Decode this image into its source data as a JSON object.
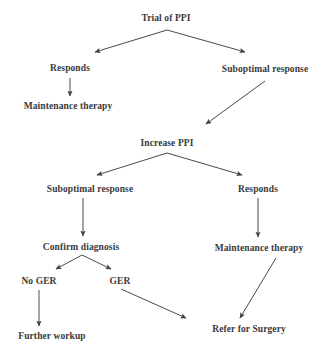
{
  "diagram": {
    "type": "flowchart",
    "title": "Trial of PPI",
    "background_color": "#ffffff",
    "text_color": "#3a3a3a",
    "line_color": "#4a4a4a",
    "nodes": [
      {
        "id": "trial-of-ppi",
        "label": "Trial of PPI",
        "x": 166,
        "y": 18
      },
      {
        "id": "responds-top",
        "label": "Responds",
        "x": 70,
        "y": 68
      },
      {
        "id": "suboptimal-response-top",
        "label": "Suboptimal response",
        "x": 265,
        "y": 69
      },
      {
        "id": "maintenance-therapy-left",
        "label": "Maintenance therapy",
        "x": 68,
        "y": 106
      },
      {
        "id": "increase-ppi",
        "label": "Increase PPI",
        "x": 167,
        "y": 143
      },
      {
        "id": "suboptimal-response-mid",
        "label": "Suboptimal response",
        "x": 90,
        "y": 189
      },
      {
        "id": "responds-mid",
        "label": "Responds",
        "x": 258,
        "y": 189
      },
      {
        "id": "confirm-diagnosis",
        "label": "Confirm diagnosis",
        "x": 81,
        "y": 247
      },
      {
        "id": "maintenance-therapy-right",
        "label": "Maintenance therapy",
        "x": 259,
        "y": 248
      },
      {
        "id": "no-ger",
        "label": "No GER",
        "x": 39,
        "y": 281
      },
      {
        "id": "ger",
        "label": "GER",
        "x": 120,
        "y": 281
      },
      {
        "id": "refer-for-surgery",
        "label": "Refer for Surgery",
        "x": 249,
        "y": 329
      },
      {
        "id": "further-workup",
        "label": "Further workup",
        "x": 52,
        "y": 336
      }
    ],
    "edges": [
      {
        "id": "trial-to-responds",
        "from": "trial-of-ppi",
        "to": "responds-top",
        "x1": 167,
        "y1": 30,
        "x2": 95,
        "y2": 52
      },
      {
        "id": "trial-to-suboptimal",
        "from": "trial-of-ppi",
        "to": "suboptimal-response-top",
        "x1": 167,
        "y1": 30,
        "x2": 245,
        "y2": 52
      },
      {
        "id": "responds-to-maintenance",
        "from": "responds-top",
        "to": "maintenance-therapy-left",
        "x1": 70,
        "y1": 78,
        "x2": 70,
        "y2": 96
      },
      {
        "id": "suboptimal-to-increase",
        "from": "suboptimal-response-top",
        "to": "increase-ppi",
        "x1": 265,
        "y1": 81,
        "x2": 206,
        "y2": 124
      },
      {
        "id": "increase-to-suboptimal",
        "from": "increase-ppi",
        "to": "suboptimal-response-mid",
        "x1": 167,
        "y1": 153,
        "x2": 97,
        "y2": 175
      },
      {
        "id": "increase-to-responds",
        "from": "increase-ppi",
        "to": "responds-mid",
        "x1": 167,
        "y1": 153,
        "x2": 242,
        "y2": 175
      },
      {
        "id": "suboptimal-to-confirm",
        "from": "suboptimal-response-mid",
        "to": "confirm-diagnosis",
        "x1": 83,
        "y1": 198,
        "x2": 83,
        "y2": 236
      },
      {
        "id": "responds-to-maintenance-right",
        "from": "responds-mid",
        "to": "maintenance-therapy-right",
        "x1": 258,
        "y1": 198,
        "x2": 258,
        "y2": 237
      },
      {
        "id": "confirm-to-no-ger",
        "from": "confirm-diagnosis",
        "to": "no-ger",
        "x1": 82,
        "y1": 255,
        "x2": 56,
        "y2": 269
      },
      {
        "id": "confirm-to-ger",
        "from": "confirm-diagnosis",
        "to": "ger",
        "x1": 82,
        "y1": 255,
        "x2": 111,
        "y2": 269
      },
      {
        "id": "no-ger-to-further-workup",
        "from": "no-ger",
        "to": "further-workup",
        "x1": 39,
        "y1": 290,
        "x2": 39,
        "y2": 326
      },
      {
        "id": "ger-to-refer",
        "from": "ger",
        "to": "refer-for-surgery",
        "x1": 121,
        "y1": 289,
        "x2": 186,
        "y2": 318
      },
      {
        "id": "maintenance-to-refer",
        "from": "maintenance-therapy-right",
        "to": "refer-for-surgery",
        "x1": 276,
        "y1": 258,
        "x2": 240,
        "y2": 318
      }
    ]
  }
}
